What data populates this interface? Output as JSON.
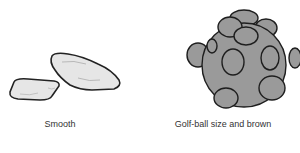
{
  "panels": [
    {
      "id": "smooth",
      "caption": "Smooth",
      "illustration": "two-smooth-stones",
      "fill": "#e6e6e6",
      "stroke": "#222222"
    },
    {
      "id": "golf-ball",
      "caption": "Golf-ball size and brown",
      "illustration": "bumpy-nodular-stone",
      "fill": "#9a9a9a",
      "stroke": "#1e1e1e"
    }
  ]
}
